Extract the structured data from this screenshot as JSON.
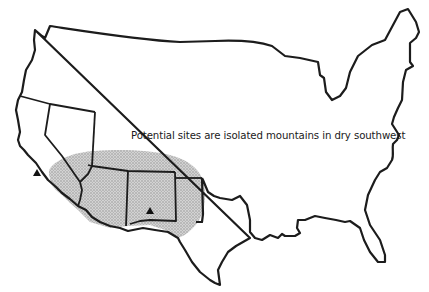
{
  "map": {
    "title": "United States outline map",
    "caption": "Potential sites are isolated mountains in dry southwest",
    "region_highlighted": "dry southwest (stippled)",
    "markers": [
      {
        "type": "mountain-triangle",
        "label": "site-california",
        "x": 37,
        "y": 172
      },
      {
        "type": "mountain-triangle",
        "label": "site-new-mexico",
        "x": 150,
        "y": 211
      }
    ],
    "colors": {
      "outline": "#1c1c1c",
      "stipple": "#b8b8b8",
      "background": "#ffffff"
    }
  }
}
